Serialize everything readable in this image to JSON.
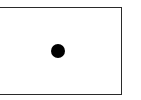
{
  "diagram": {
    "shapes": [
      {
        "type": "rectangle",
        "name": "frame",
        "fill": "#ffffff",
        "stroke": "#2a2a2a"
      },
      {
        "type": "circle",
        "name": "dot",
        "fill": "#000000",
        "cx": 58,
        "cy": 51,
        "diameter": 14
      }
    ]
  }
}
